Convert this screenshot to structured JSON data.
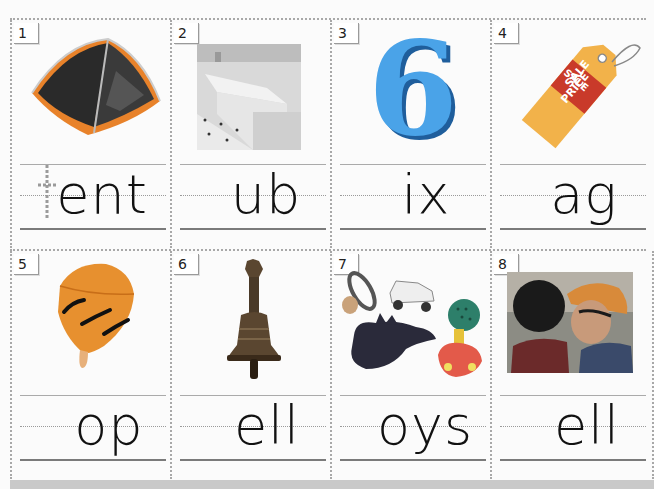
{
  "worksheet": {
    "task": "Write the missing beginning letter for each picture",
    "cards": [
      {
        "number": "1",
        "picture": "tent",
        "word_shown": "ent",
        "traced_letter": "t",
        "picture_color": "#e8822a"
      },
      {
        "number": "2",
        "picture": "bathtub",
        "word_shown": "ub",
        "traced_letter": "",
        "picture_color": "#e9e9e9"
      },
      {
        "number": "3",
        "picture": "number six",
        "word_shown": "ix",
        "traced_letter": "",
        "picture_color": "#3b8fd6"
      },
      {
        "number": "4",
        "picture": "price tag",
        "word_shown": "ag",
        "traced_letter": "",
        "picture_color": "#f5a623",
        "tag_text_line1": "SALE",
        "tag_text_line2": "PRICE"
      },
      {
        "number": "5",
        "picture": "top",
        "word_shown": "op",
        "traced_letter": "",
        "picture_color": "#f29a3a"
      },
      {
        "number": "6",
        "picture": "bell",
        "word_shown": "ell",
        "traced_letter": "",
        "picture_color": "#5a4630"
      },
      {
        "number": "7",
        "picture": "toys",
        "word_shown": "oys",
        "traced_letter": "",
        "picture_color": "#4a4a6a"
      },
      {
        "number": "8",
        "picture": "girls telling a secret",
        "word_shown": "ell",
        "traced_letter": "",
        "picture_color": "#7a6a5a"
      }
    ]
  }
}
